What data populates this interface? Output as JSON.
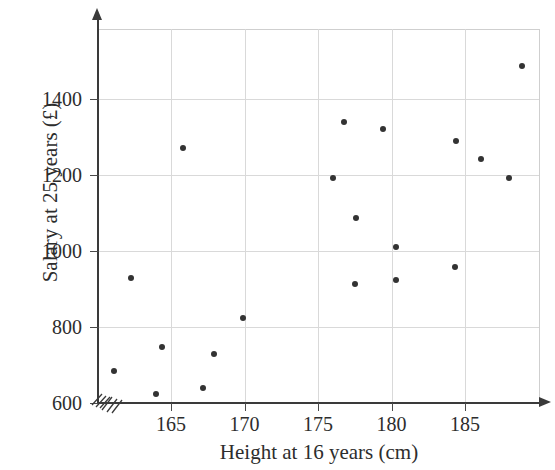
{
  "figure": {
    "top_cropped_text": "",
    "background_color": "#ffffff",
    "point_color": "#333333",
    "axis_color": "#3a3a3a",
    "grid_color": "#d9d9d9"
  },
  "chart_data": {
    "type": "scatter",
    "title": "",
    "xlabel": "Height at 16 years (cm)",
    "ylabel": "Salary at 25 years (£)",
    "xlim": [
      160,
      190
    ],
    "ylim": [
      600,
      1500
    ],
    "xticks": [
      165,
      170,
      175,
      180,
      185
    ],
    "yticks": [
      600,
      800,
      1000,
      1200,
      1400
    ],
    "xtick_labels": [
      "165",
      "170",
      "175",
      "180",
      "185"
    ],
    "ytick_labels": [
      "600",
      "800",
      "1000",
      "1200",
      "1400"
    ],
    "grid": true,
    "legend": "none",
    "axis_break_x": true,
    "axis_break_y": true,
    "points": [
      {
        "x": 161.1,
        "y": 683
      },
      {
        "x": 162.3,
        "y": 928
      },
      {
        "x": 164.0,
        "y": 625
      },
      {
        "x": 164.4,
        "y": 748
      },
      {
        "x": 165.8,
        "y": 1270
      },
      {
        "x": 167.2,
        "y": 639
      },
      {
        "x": 167.9,
        "y": 730
      },
      {
        "x": 169.9,
        "y": 823
      },
      {
        "x": 176.0,
        "y": 1191
      },
      {
        "x": 176.8,
        "y": 1340
      },
      {
        "x": 177.6,
        "y": 1088
      },
      {
        "x": 177.5,
        "y": 912
      },
      {
        "x": 179.4,
        "y": 1320
      },
      {
        "x": 180.3,
        "y": 923
      },
      {
        "x": 180.3,
        "y": 1010
      },
      {
        "x": 184.3,
        "y": 958
      },
      {
        "x": 184.4,
        "y": 1290
      },
      {
        "x": 186.1,
        "y": 1241
      },
      {
        "x": 188.0,
        "y": 1191
      },
      {
        "x": 188.9,
        "y": 1488
      }
    ]
  }
}
